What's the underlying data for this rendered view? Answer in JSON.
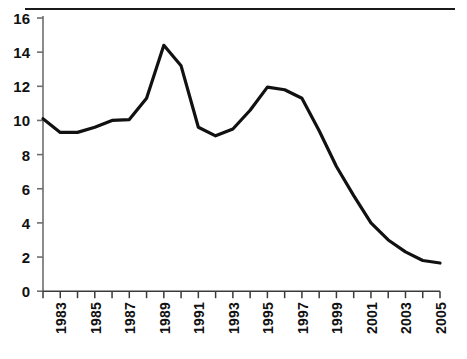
{
  "chart_data": {
    "type": "line",
    "title": "",
    "subtitle": "",
    "xlabel": "",
    "ylabel": "",
    "xlim": [
      1982,
      2005
    ],
    "ylim": [
      0,
      16
    ],
    "yticks": [
      0,
      2,
      4,
      6,
      8,
      10,
      12,
      14,
      16
    ],
    "ytick_labels": [
      "0",
      "2",
      "4",
      "6",
      "8",
      "10",
      "12",
      "14",
      "16"
    ],
    "xticks": [
      1982,
      1983,
      1984,
      1985,
      1986,
      1987,
      1988,
      1989,
      1990,
      1991,
      1992,
      1993,
      1994,
      1995,
      1996,
      1997,
      1998,
      1999,
      2000,
      2001,
      2002,
      2003,
      2004,
      2005
    ],
    "xtick_labels": [
      "",
      "1983",
      "",
      "1985",
      "",
      "1987",
      "",
      "1989",
      "",
      "1991",
      "",
      "1993",
      "",
      "1995",
      "",
      "1997",
      "",
      "1999",
      "",
      "2001",
      "",
      "2003",
      "",
      "2005"
    ],
    "grid": false,
    "legend": null,
    "line_color": "#111111",
    "line_width": 3.2,
    "x": [
      1982,
      1983,
      1984,
      1985,
      1986,
      1987,
      1988,
      1989,
      1990,
      1991,
      1992,
      1993,
      1994,
      1995,
      1996,
      1997,
      1998,
      1999,
      2000,
      2001,
      2002,
      2003,
      2004,
      2005
    ],
    "values": [
      10.1,
      9.3,
      9.3,
      9.6,
      10.0,
      10.05,
      11.3,
      14.4,
      13.2,
      9.6,
      9.1,
      9.5,
      10.6,
      11.95,
      11.8,
      11.3,
      9.4,
      7.3,
      5.6,
      4.0,
      3.0,
      2.3,
      1.8,
      1.65
    ],
    "series": [
      {
        "name": "",
        "values": [
          10.1,
          9.3,
          9.3,
          9.6,
          10.0,
          10.05,
          11.3,
          14.4,
          13.2,
          9.6,
          9.1,
          9.5,
          10.6,
          11.95,
          11.8,
          11.3,
          9.4,
          7.3,
          5.6,
          4.0,
          3.0,
          2.3,
          1.8,
          1.65
        ]
      }
    ],
    "annotations": []
  },
  "axes": {
    "y_axis_name": "value-axis",
    "x_axis_name": "year-axis"
  },
  "decoration": {
    "top_rule": true
  }
}
